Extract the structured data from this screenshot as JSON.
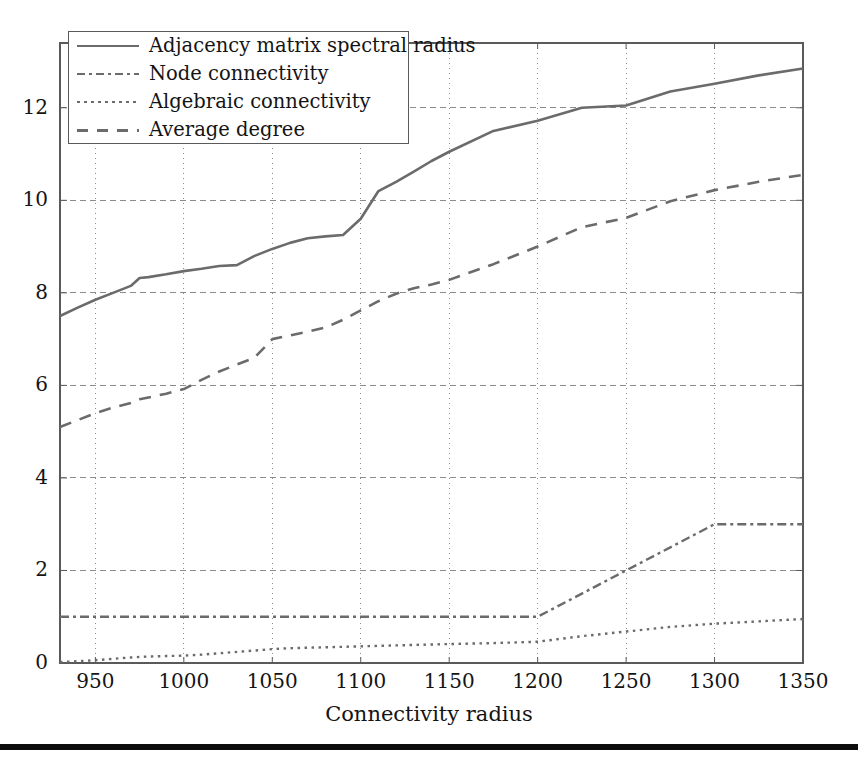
{
  "figure": {
    "xaxis_title": "Connectivity radius",
    "plot_bg": "#ffffff",
    "line_color": "#6b6b6b",
    "grid_color": "#8c8c8c",
    "axis_color": "#5a5a5a",
    "rule_color": "#0d0d0d"
  },
  "legend": {
    "items": [
      {
        "label": "Adjacency matrix spectral radius",
        "style": "solid",
        "icon": "line-solid-icon"
      },
      {
        "label": "Node connectivity",
        "style": "dashdot",
        "icon": "line-dashdot-icon"
      },
      {
        "label": "Algebraic connectivity",
        "style": "dotted",
        "icon": "line-dotted-icon"
      },
      {
        "label": "Average degree",
        "style": "dashed",
        "icon": "line-dashed-icon"
      }
    ]
  },
  "axes": {
    "x_ticks": [
      "950",
      "1000",
      "1050",
      "1100",
      "1150",
      "1200",
      "1250",
      "1300",
      "1350"
    ],
    "y_ticks": [
      "0",
      "2",
      "4",
      "6",
      "8",
      "10",
      "12"
    ]
  },
  "chart_data": {
    "type": "line",
    "title": "",
    "xlabel": "Connectivity radius",
    "ylabel": "",
    "xlim": [
      930,
      1350
    ],
    "ylim": [
      0,
      13.4
    ],
    "xticks": [
      950,
      1000,
      1050,
      1100,
      1150,
      1200,
      1250,
      1300,
      1350
    ],
    "yticks": [
      0,
      2,
      4,
      6,
      8,
      10,
      12
    ],
    "grid": true,
    "legend_position": "upper left",
    "x": [
      930,
      940,
      950,
      960,
      970,
      975,
      980,
      990,
      1000,
      1010,
      1020,
      1030,
      1040,
      1050,
      1060,
      1070,
      1080,
      1090,
      1100,
      1110,
      1120,
      1130,
      1140,
      1150,
      1175,
      1200,
      1225,
      1250,
      1275,
      1300,
      1325,
      1350
    ],
    "series": [
      {
        "name": "Adjacency matrix spectral radius",
        "style": "solid",
        "values": [
          7.5,
          7.68,
          7.85,
          8.0,
          8.15,
          8.32,
          8.34,
          8.4,
          8.47,
          8.52,
          8.58,
          8.6,
          8.8,
          8.95,
          9.08,
          9.18,
          9.22,
          9.25,
          9.6,
          10.2,
          10.4,
          10.62,
          10.85,
          11.05,
          11.5,
          11.72,
          12.0,
          12.05,
          12.35,
          12.52,
          12.7,
          12.85
        ]
      },
      {
        "name": "Node connectivity",
        "style": "dashdot",
        "values": [
          1,
          1,
          1,
          1,
          1,
          1,
          1,
          1,
          1,
          1,
          1,
          1,
          1,
          1,
          1,
          1,
          1,
          1,
          1,
          1,
          1,
          1,
          1,
          1,
          1,
          1,
          1.5,
          2,
          2.5,
          3,
          3,
          3
        ]
      },
      {
        "name": "Algebraic connectivity",
        "style": "dotted",
        "values": [
          0.02,
          0.04,
          0.06,
          0.09,
          0.12,
          0.13,
          0.14,
          0.15,
          0.16,
          0.18,
          0.21,
          0.24,
          0.27,
          0.3,
          0.32,
          0.33,
          0.34,
          0.35,
          0.36,
          0.37,
          0.38,
          0.39,
          0.4,
          0.41,
          0.43,
          0.46,
          0.58,
          0.68,
          0.78,
          0.85,
          0.9,
          0.95
        ]
      },
      {
        "name": "Average degree",
        "style": "dashed",
        "values": [
          5.1,
          5.25,
          5.4,
          5.52,
          5.62,
          5.7,
          5.74,
          5.82,
          5.92,
          6.12,
          6.3,
          6.45,
          6.6,
          7.0,
          7.08,
          7.16,
          7.25,
          7.42,
          7.62,
          7.82,
          7.98,
          8.1,
          8.18,
          8.28,
          8.62,
          9.0,
          9.42,
          9.62,
          9.98,
          10.22,
          10.4,
          10.55
        ]
      }
    ]
  }
}
